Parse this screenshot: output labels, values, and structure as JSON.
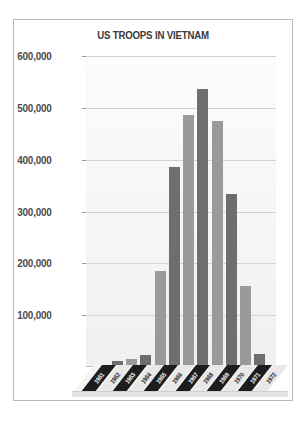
{
  "chart_data": {
    "type": "bar",
    "title": "US TROOPS IN VIETNAM",
    "xlabel": "",
    "ylabel": "",
    "categories": [
      "1961",
      "1962",
      "1963",
      "1964",
      "1965",
      "1966",
      "1967",
      "1968",
      "1969",
      "1970",
      "1971",
      "1972"
    ],
    "values": [
      3200,
      11000,
      16300,
      23300,
      184300,
      385300,
      485600,
      536100,
      475200,
      334600,
      156800,
      24200
    ],
    "ylim": [
      0,
      600000
    ],
    "ytick_labels": [
      "600,000",
      "500,000",
      "400,000",
      "300,000",
      "200,000",
      "100,000"
    ],
    "ytick_values": [
      600000,
      500000,
      400000,
      300000,
      200000,
      100000
    ],
    "grid": true,
    "legend": "none",
    "bar_colors": [
      "#9a9a9a",
      "#6e6e6e",
      "#9a9a9a",
      "#6e6e6e",
      "#9a9a9a",
      "#6e6e6e",
      "#9a9a9a",
      "#6e6e6e",
      "#9a9a9a",
      "#6e6e6e",
      "#9a9a9a",
      "#6e6e6e"
    ]
  },
  "figure": {
    "border_color": "#b9b9b9",
    "background": "#ffffff",
    "plot_background": "#f4f4f4",
    "gridline_color": "#d2d2d2",
    "axis_label_color": "#4a4a4a",
    "title_color": "#3a3a3a"
  }
}
